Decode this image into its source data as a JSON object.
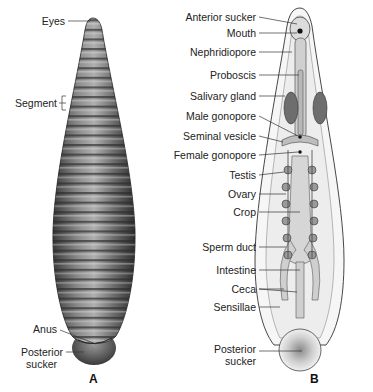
{
  "figure": {
    "panel_a": {
      "letter": "A",
      "view": "external",
      "labels": {
        "eyes": "Eyes",
        "segment": "Segment",
        "anus": "Anus",
        "posterior_sucker_1": "Posterior",
        "posterior_sucker_2": "sucker"
      }
    },
    "panel_b": {
      "letter": "B",
      "view": "internal",
      "labels": {
        "anterior_sucker": "Anterior sucker",
        "mouth": "Mouth",
        "nephridiopore": "Nephridiopore",
        "proboscis": "Proboscis",
        "salivary_gland": "Salivary gland",
        "male_gonopore": "Male gonopore",
        "seminal_vesicle": "Seminal vesicle",
        "female_gonopore": "Female gonopore",
        "testis": "Testis",
        "ovary": "Ovary",
        "crop": "Crop",
        "sperm_duct": "Sperm duct",
        "intestine": "Intestine",
        "ceca": "Ceca",
        "sensillae": "Sensillae",
        "posterior_sucker_1": "Posterior",
        "posterior_sucker_2": "sucker"
      }
    },
    "colors": {
      "body_dark": "#4a4a4a",
      "body_light": "#bdbdbd",
      "internal_fill": "#e6e6e6",
      "organ_gray": "#9a9a9a",
      "label_text": "#222222"
    }
  }
}
